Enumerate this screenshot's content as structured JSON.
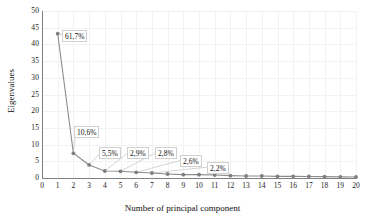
{
  "chart_data": {
    "type": "line",
    "title": "",
    "xlabel": "Number of principal component",
    "ylabel": "Eigenvalues",
    "xlim": [
      0,
      20
    ],
    "ylim": [
      0,
      50
    ],
    "grid": true,
    "legend": "none",
    "x": [
      1,
      2,
      3,
      4,
      5,
      6,
      7,
      8,
      9,
      10,
      11,
      12,
      13,
      14,
      15,
      16,
      17,
      18,
      19,
      20
    ],
    "xticks": [
      "0",
      "1",
      "2",
      "3",
      "4",
      "5",
      "6",
      "7",
      "8",
      "9",
      "10",
      "11",
      "12",
      "13",
      "14",
      "15",
      "16",
      "17",
      "18",
      "19",
      "20"
    ],
    "yticks": [
      "0",
      "5",
      "10",
      "15",
      "20",
      "25",
      "30",
      "35",
      "40",
      "45",
      "50"
    ],
    "series": [
      {
        "name": "Eigenvalues",
        "color": "#8c8c8c",
        "marker": "circle",
        "values": [
          43.2,
          7.4,
          3.9,
          2.1,
          2.0,
          1.7,
          1.5,
          1.2,
          1.0,
          1.0,
          0.9,
          0.7,
          0.6,
          0.6,
          0.5,
          0.5,
          0.45,
          0.4,
          0.35,
          0.3
        ]
      }
    ],
    "annotations": [
      {
        "label": "61,7%",
        "point": 1,
        "left": 62,
        "top": 30
      },
      {
        "label": "10,6%",
        "point": 2,
        "left": 74,
        "top": 126
      },
      {
        "label": "5,5%",
        "point": 3,
        "left": 99,
        "top": 147
      },
      {
        "label": "2,9%",
        "point": 4,
        "left": 127,
        "top": 147
      },
      {
        "label": "2,8%",
        "point": 5,
        "left": 155,
        "top": 147
      },
      {
        "label": "2,6%",
        "point": 6,
        "left": 180,
        "top": 155
      },
      {
        "label": "2,2%",
        "point": 7,
        "left": 207,
        "top": 162
      }
    ]
  },
  "colors": {
    "series": "#8c8c8c",
    "axis": "#808080",
    "grid": "#f2f2f2",
    "label_border": "#d0d0d0",
    "text": "#111111"
  }
}
